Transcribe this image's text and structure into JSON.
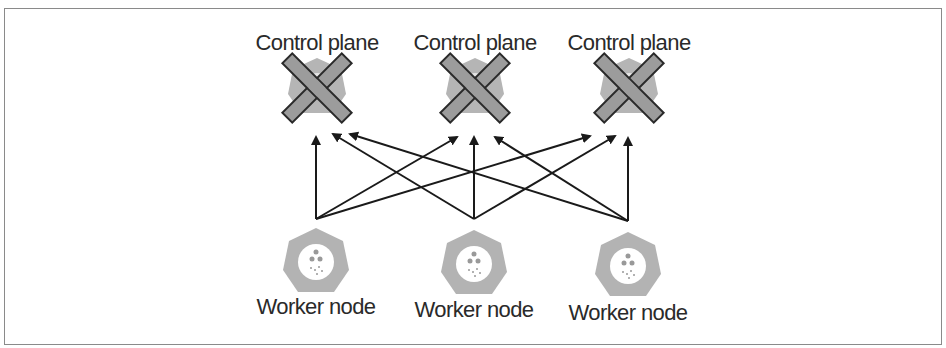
{
  "diagram": {
    "control_planes": [
      {
        "label": "Control plane",
        "status": "failed",
        "cx": 317,
        "cy": 88
      },
      {
        "label": "Control plane",
        "status": "failed",
        "cx": 475,
        "cy": 88
      },
      {
        "label": "Control plane",
        "status": "failed",
        "cx": 629,
        "cy": 88
      }
    ],
    "worker_nodes": [
      {
        "label": "Worker node",
        "cx": 316,
        "cy": 262
      },
      {
        "label": "Worker node",
        "cx": 474,
        "cy": 264
      },
      {
        "label": "Worker node",
        "cx": 628,
        "cy": 266
      }
    ],
    "connections": "each worker node connects to every control plane",
    "colors": {
      "node_fill": "#b3b3b3",
      "x_fill": "#9c9c9c",
      "x_stroke": "#2a2a2a",
      "arrow": "#1a1a1a",
      "border": "#8a8a8a",
      "text": "#2a2a2a"
    }
  }
}
